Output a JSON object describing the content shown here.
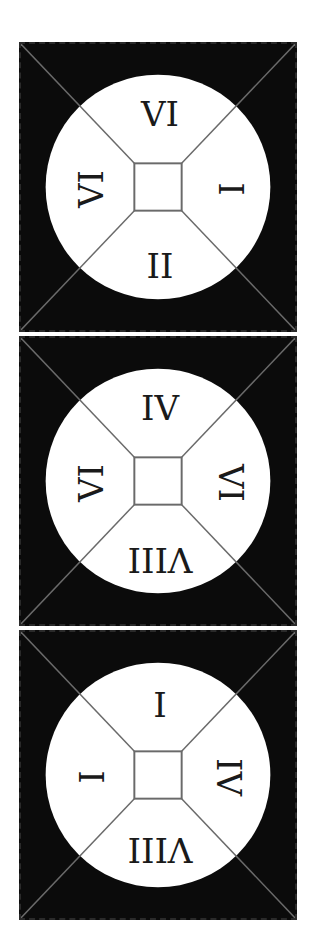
{
  "diagram": {
    "tiles": [
      {
        "labels": {
          "top": {
            "text": "VI",
            "rotation": 0
          },
          "right": {
            "text": "I",
            "rotation": 90
          },
          "bottom": {
            "text": "II",
            "rotation": 0
          },
          "left": {
            "text": "VI",
            "rotation": -90
          }
        }
      },
      {
        "labels": {
          "top": {
            "text": "IV",
            "rotation": 0
          },
          "right": {
            "text": "VI",
            "rotation": 90
          },
          "bottom": {
            "text": "VIII",
            "rotation": 180
          },
          "left": {
            "text": "VI",
            "rotation": -90
          }
        }
      },
      {
        "labels": {
          "top": {
            "text": "I",
            "rotation": 180
          },
          "right": {
            "text": "IV",
            "rotation": 90
          },
          "bottom": {
            "text": "VIII",
            "rotation": 180
          },
          "left": {
            "text": "I",
            "rotation": 90
          }
        }
      }
    ],
    "colors": {
      "tile_background": "#0b0b0b",
      "circle_fill": "#ffffff",
      "line_color": "#6a6a6a",
      "text_color": "#1a1a1a"
    }
  }
}
